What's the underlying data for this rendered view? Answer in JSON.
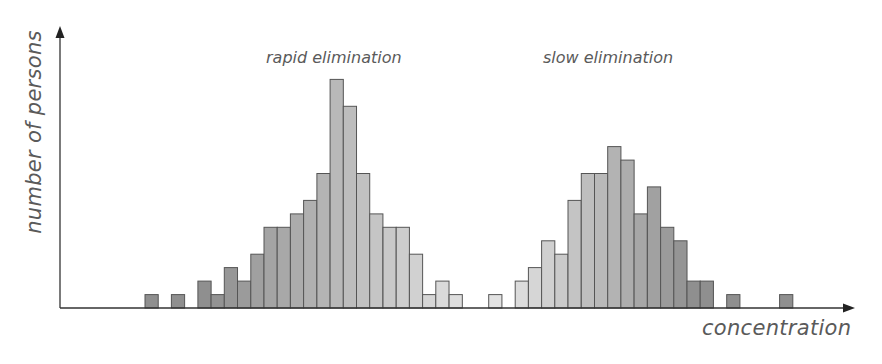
{
  "chart_data": {
    "type": "bar",
    "title": "",
    "xlabel": "concentration",
    "ylabel": "number of persons",
    "grid": false,
    "legend": null,
    "annotations": [
      {
        "text": "rapid elimination",
        "near_bin": 11
      },
      {
        "text": "slow elimination",
        "near_bin": 33
      }
    ],
    "bins": 49,
    "x": [
      0,
      1,
      2,
      3,
      4,
      5,
      6,
      7,
      8,
      9,
      10,
      11,
      12,
      13,
      14,
      15,
      16,
      17,
      18,
      19,
      20,
      21,
      22,
      23,
      24,
      25,
      26,
      27,
      28,
      29,
      30,
      31,
      32,
      33,
      34,
      35,
      36,
      37,
      38,
      39,
      40,
      41,
      42,
      43,
      44,
      45,
      46,
      47,
      48
    ],
    "series": [
      {
        "name": "rapid elimination",
        "values": [
          1,
          0,
          1,
          0,
          2,
          1,
          3,
          2,
          4,
          6,
          6,
          7,
          8,
          10,
          17,
          15,
          10,
          7,
          6,
          6,
          4,
          1,
          2,
          1,
          0,
          0,
          0,
          0,
          0,
          0,
          0,
          0,
          0,
          0,
          0,
          0,
          0,
          0,
          0,
          0,
          0,
          0,
          0,
          0,
          0,
          0,
          0,
          0,
          0
        ]
      },
      {
        "name": "slow elimination",
        "values": [
          0,
          0,
          0,
          0,
          0,
          0,
          0,
          0,
          0,
          0,
          0,
          0,
          0,
          0,
          0,
          0,
          0,
          0,
          0,
          0,
          0,
          0,
          0,
          0,
          0,
          0,
          1,
          0,
          2,
          3,
          5,
          4,
          8,
          10,
          10,
          12,
          11,
          7,
          9,
          6,
          5,
          2,
          2,
          0,
          1,
          0,
          0,
          0,
          1
        ]
      }
    ],
    "ylim": [
      0,
      18
    ]
  },
  "labels": {
    "ylabel": "number of persons",
    "xlabel": "concentration",
    "rapid": "rapid elimination",
    "slow": "slow elimination"
  },
  "colors": {
    "axis": "#333333",
    "bar_stroke": "#555555",
    "dark": [
      143,
      143,
      143
    ],
    "light": [
      226,
      226,
      226
    ]
  }
}
